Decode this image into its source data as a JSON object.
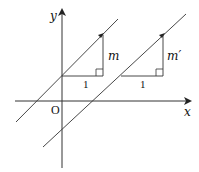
{
  "diagram": {
    "type": "coordinate-plane-parallel-lines",
    "axes": {
      "x_label": "x",
      "y_label": "y",
      "origin_label": "O"
    },
    "lines": [
      {
        "name": "line-1",
        "slope_label": "m",
        "run_label": "1"
      },
      {
        "name": "line-2",
        "slope_label": "m′",
        "run_label": "1"
      }
    ],
    "colors": {
      "stroke": "#333333",
      "background": "#ffffff"
    }
  }
}
